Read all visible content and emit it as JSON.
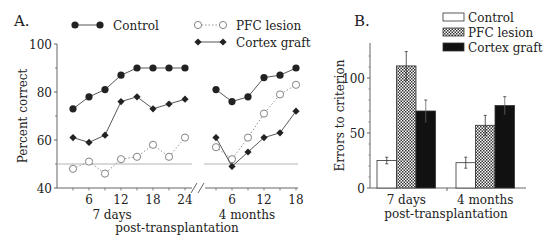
{
  "figure": {
    "panel_a_label": "A.",
    "panel_b_label": "B."
  },
  "colors": {
    "ink": "#222222",
    "axis": "#555555",
    "chance_line": "#aaaaaa",
    "pfc_line": "#888888"
  },
  "chart_data": [
    {
      "type": "line",
      "panel": "A",
      "title": "",
      "xlabel": "post-transplantation",
      "ylabel": "Percent correct",
      "ylim": [
        40,
        100
      ],
      "yticks": [
        40,
        60,
        80,
        100
      ],
      "grid": false,
      "legend_position": "top",
      "reference_line": {
        "y": 50,
        "label": "chance"
      },
      "segments": [
        {
          "label": "7 days",
          "x": [
            3,
            6,
            9,
            12,
            15,
            18,
            21,
            24
          ],
          "xtick_labels": [
            "6",
            "12",
            "18",
            "24"
          ],
          "series": [
            {
              "name": "Control",
              "marker": "filled-circle",
              "line": "solid",
              "values": [
                73,
                78,
                81,
                87,
                90,
                90,
                90,
                90
              ]
            },
            {
              "name": "PFC lesion",
              "marker": "open-circle",
              "line": "dotted",
              "values": [
                48,
                51,
                46,
                52,
                53,
                58,
                53,
                61
              ]
            },
            {
              "name": "Cortex graft",
              "marker": "filled-diamond",
              "line": "solid",
              "values": [
                61,
                59,
                62,
                76,
                78,
                73,
                75,
                77
              ]
            }
          ]
        },
        {
          "label": "4 months",
          "x": [
            3,
            6,
            9,
            12,
            15,
            18
          ],
          "xtick_labels": [
            "6",
            "12",
            "18"
          ],
          "series": [
            {
              "name": "Control",
              "marker": "filled-circle",
              "line": "solid",
              "values": [
                81,
                76,
                78,
                86,
                87,
                90
              ]
            },
            {
              "name": "PFC lesion",
              "marker": "open-circle",
              "line": "dotted",
              "values": [
                57,
                52,
                61,
                71,
                79,
                83
              ]
            },
            {
              "name": "Cortex graft",
              "marker": "filled-diamond",
              "line": "solid",
              "values": [
                61,
                49,
                55,
                61,
                63,
                72
              ]
            }
          ]
        }
      ],
      "legend": [
        "Control",
        "PFC lesion",
        "Cortex graft"
      ]
    },
    {
      "type": "bar",
      "panel": "B",
      "title": "",
      "xlabel": "post-transplantation",
      "ylabel": "Errors to criterion",
      "ylim": [
        0,
        130
      ],
      "yticks": [
        0,
        50,
        100
      ],
      "grid": false,
      "legend_position": "top-right",
      "categories": [
        "7 days",
        "4 months"
      ],
      "series": [
        {
          "name": "Control",
          "fill": "white",
          "values": [
            25,
            23
          ],
          "errors": [
            3,
            5
          ]
        },
        {
          "name": "PFC lesion",
          "fill": "crosshatch",
          "values": [
            111,
            57
          ],
          "errors": [
            13,
            9
          ]
        },
        {
          "name": "Cortex graft",
          "fill": "black",
          "values": [
            70,
            75
          ],
          "errors": [
            10,
            8
          ]
        }
      ],
      "legend": [
        "Control",
        "PFC lesion",
        "Cortex graft"
      ]
    }
  ]
}
